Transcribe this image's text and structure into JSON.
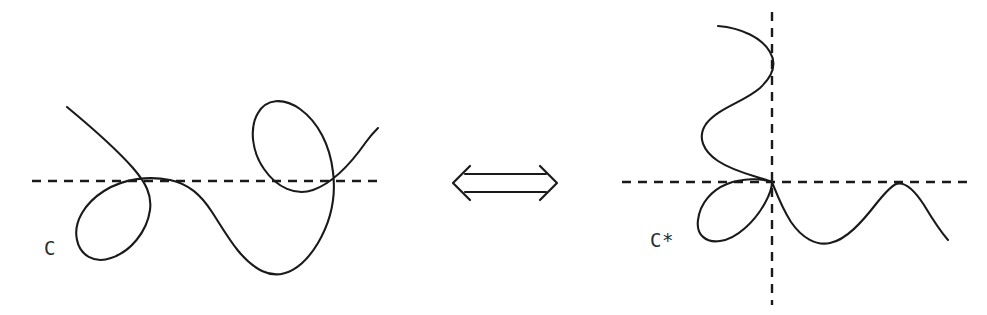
{
  "figure": {
    "background_color": "#ffffff",
    "stroke_color": "#1a1a1a",
    "label_color": "#2a2a2a"
  },
  "left_panel": {
    "label": "C",
    "label_position": {
      "x": 44,
      "y": 255
    },
    "description": "Plane curve with a node on the horizontal dashed line and a loop above right",
    "axes": [
      {
        "name": "horizontal-dashed-axis",
        "orientation": "horizontal",
        "x1": 32,
        "y1": 181,
        "x2": 378,
        "y2": 181,
        "dash": "9 7"
      }
    ],
    "curve_path": "M 67,107 C 96,131 118,151 133,168 C 146,183 152,195 150,210 C 147,232 130,252 111,258 C 94,264 80,255 77,240 C 73,222 85,203 104,191 C 124,178 150,176 170,180 C 189,184 201,195 212,212 C 227,235 240,260 262,271 C 283,281 303,268 318,243 C 331,221 336,196 333,172 C 330,145 318,122 300,109 C 283,97 266,99 258,113 C 249,128 252,152 264,169 C 277,188 296,196 313,190 C 333,183 352,162 366,142 C 371,135 375,131 378,128",
    "curve_notes": "single continuous stroke, node near (160,180) and node near (320,181)"
  },
  "right_panel": {
    "label": "C*",
    "label_position": {
      "x": 650,
      "y": 247
    },
    "description": "Transformed curve with vertical tangent wiggle, a petal below left of origin, and a wave to the right",
    "axes": [
      {
        "name": "horizontal-dashed-axis",
        "orientation": "horizontal",
        "x1": 622,
        "y1": 182,
        "x2": 970,
        "y2": 182,
        "dash": "9 7"
      },
      {
        "name": "vertical-dashed-axis",
        "orientation": "vertical",
        "x1": 772,
        "y1": 12,
        "x2": 772,
        "y2": 305,
        "dash": "9 7"
      }
    ],
    "origin": {
      "x": 772,
      "y": 182
    },
    "curve_path": "M 718,26 C 742,28 762,38 770,52 C 777,64 773,76 760,88 C 744,102 718,108 706,124 C 697,137 703,151 718,161 C 736,173 760,177 772,182 C 762,178 742,178 727,184 C 712,190 700,203 698,220 C 696,235 706,243 720,241 C 737,239 755,221 765,203 C 770,194 772,186 772,182 C 776,192 782,208 791,222 C 802,238 816,246 830,243 C 846,240 862,222 876,204 C 884,194 890,187 896,184 C 905,181 915,191 924,205 C 933,220 941,232 948,240",
    "curve_notes": "upper S-wiggle tangent to vertical axis near (771,52), passes through origin, petal loop lower-left, sine wave to the right tangent to axis near (893,183)"
  },
  "center_symbol": {
    "name": "iff-double-arrow",
    "glyph": "double-headed-arrow",
    "meaning": "if and only if",
    "bounds": {
      "x": 453,
      "y": 165,
      "width": 104,
      "height": 36
    }
  }
}
